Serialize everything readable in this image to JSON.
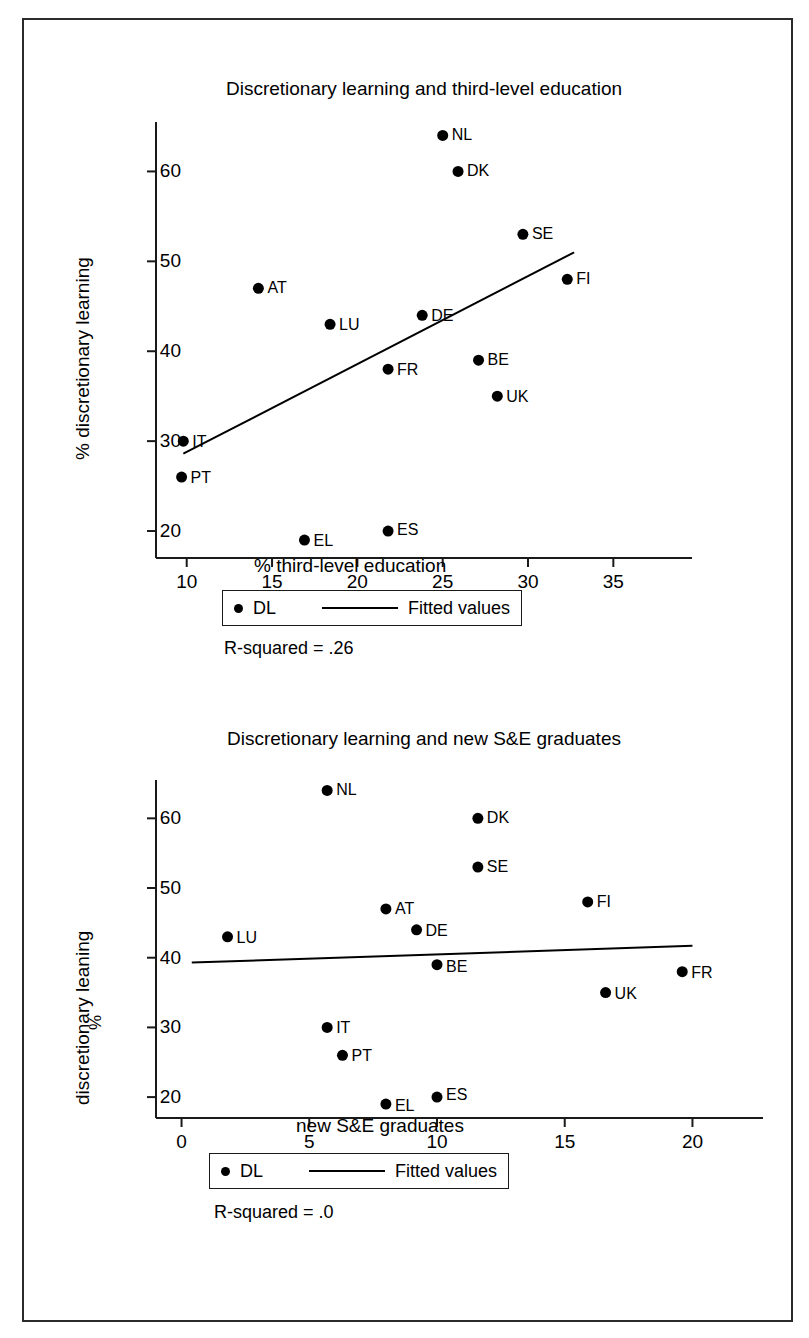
{
  "figure": {
    "background": "#ffffff",
    "frame_color": "#2b2b2b",
    "marker_color": "#000000",
    "line_color": "#000000"
  },
  "panel1": {
    "title": "Discretionary learning and third-level education",
    "xlabel": "% third-level education",
    "ylabel": "% discretionary learning",
    "rsquared_text": "R-squared = .26",
    "legend": {
      "marker_label": "DL",
      "line_label": "Fitted values"
    },
    "xticks": [
      "10",
      "15",
      "20",
      "25",
      "30",
      "35"
    ],
    "yticks": [
      "20",
      "30",
      "40",
      "50",
      "60"
    ]
  },
  "panel2": {
    "title": "Discretionary learning and new S&E graduates",
    "xlabel": "new S&E graduates",
    "ylabel": "discretionary leaning",
    "ylabel_percent": "%",
    "rsquared_text": "R-squared = .0",
    "legend": {
      "marker_label": "DL",
      "line_label": "Fitted values"
    },
    "xticks": [
      "0",
      "5",
      "10",
      "15",
      "20"
    ],
    "yticks": [
      "20",
      "30",
      "40",
      "50",
      "60"
    ]
  },
  "chart_data": [
    {
      "type": "scatter",
      "id": "discretionary-learning-vs-third-level-education",
      "title": "Discretionary learning and third-level education",
      "xlabel": "% third-level education",
      "ylabel": "% discretionary learning",
      "xlim": [
        8.2,
        35.8
      ],
      "ylim": [
        17.0,
        65.5
      ],
      "xticks": [
        10,
        15,
        20,
        25,
        30,
        35
      ],
      "yticks": [
        20,
        30,
        40,
        50,
        60
      ],
      "grid": false,
      "legend": [
        "DL",
        "Fitted values"
      ],
      "legend_position": "below-axes",
      "annotation": "R-squared = .26",
      "r_squared": 0.26,
      "points": [
        {
          "label": "NL",
          "x": 25.0,
          "y": 64.0
        },
        {
          "label": "DK",
          "x": 25.9,
          "y": 60.0
        },
        {
          "label": "SE",
          "x": 29.7,
          "y": 53.0
        },
        {
          "label": "FI",
          "x": 32.3,
          "y": 48.0
        },
        {
          "label": "AT",
          "x": 14.2,
          "y": 47.0
        },
        {
          "label": "DE",
          "x": 23.8,
          "y": 44.0
        },
        {
          "label": "LU",
          "x": 18.4,
          "y": 43.0
        },
        {
          "label": "BE",
          "x": 27.1,
          "y": 39.0
        },
        {
          "label": "FR",
          "x": 21.8,
          "y": 38.0
        },
        {
          "label": "UK",
          "x": 28.2,
          "y": 35.0
        },
        {
          "label": "IT",
          "x": 9.8,
          "y": 30.0
        },
        {
          "label": "PT",
          "x": 9.7,
          "y": 26.0
        },
        {
          "label": "ES",
          "x": 21.8,
          "y": 20.0
        },
        {
          "label": "EL",
          "x": 16.9,
          "y": 19.0
        }
      ],
      "fitted_line": {
        "x0": 9.8,
        "y0": 28.6,
        "x1": 32.7,
        "y1": 51.0
      }
    },
    {
      "type": "scatter",
      "id": "discretionary-learning-vs-new-se-graduates",
      "title": "Discretionary learning and new S&E graduates",
      "xlabel": "new S&E graduates",
      "ylabel": "% discretionary leaning",
      "xlim": [
        -1.0,
        21.0
      ],
      "ylim": [
        17.0,
        65.5
      ],
      "xticks": [
        0,
        5,
        10,
        15,
        20
      ],
      "yticks": [
        20,
        30,
        40,
        50,
        60
      ],
      "grid": false,
      "legend": [
        "DL",
        "Fitted values"
      ],
      "legend_position": "below-axes",
      "annotation": "R-squared = .0",
      "r_squared": 0.0,
      "points": [
        {
          "label": "NL",
          "x": 5.7,
          "y": 64.0
        },
        {
          "label": "DK",
          "x": 11.6,
          "y": 60.0
        },
        {
          "label": "SE",
          "x": 11.6,
          "y": 53.0
        },
        {
          "label": "FI",
          "x": 15.9,
          "y": 48.0
        },
        {
          "label": "AT",
          "x": 8.0,
          "y": 47.0
        },
        {
          "label": "DE",
          "x": 9.2,
          "y": 44.0
        },
        {
          "label": "LU",
          "x": 1.8,
          "y": 43.0
        },
        {
          "label": "BE",
          "x": 10.0,
          "y": 39.0
        },
        {
          "label": "FR",
          "x": 19.6,
          "y": 38.0
        },
        {
          "label": "UK",
          "x": 16.6,
          "y": 35.0
        },
        {
          "label": "IT",
          "x": 5.7,
          "y": 30.0
        },
        {
          "label": "PT",
          "x": 6.3,
          "y": 26.0
        },
        {
          "label": "ES",
          "x": 10.0,
          "y": 20.0
        },
        {
          "label": "EL",
          "x": 8.0,
          "y": 19.0
        }
      ],
      "fitted_line": {
        "x0": 0.4,
        "y0": 39.3,
        "x1": 20.0,
        "y1": 41.7
      }
    }
  ]
}
